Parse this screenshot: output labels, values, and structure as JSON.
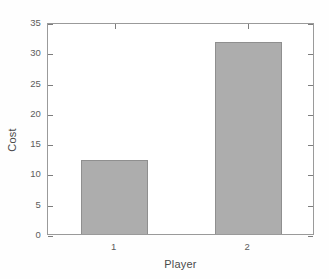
{
  "figure": {
    "background_color": "#ffffff",
    "axis_color": "#9a9a9a",
    "text_color": "#5c5c5c"
  },
  "axis_titles": {
    "x": "Player",
    "y": "Cost"
  },
  "y_ticks": [
    "0",
    "5",
    "10",
    "15",
    "20",
    "25",
    "30",
    "35"
  ],
  "x_ticks": [
    "1",
    "2"
  ],
  "chart_data": {
    "type": "bar",
    "title": "",
    "xlabel": "Player",
    "ylabel": "Cost",
    "categories": [
      "1",
      "2"
    ],
    "values": [
      12.3,
      31.7
    ],
    "ylim": [
      0,
      35
    ],
    "ytick_values": [
      0,
      5,
      10,
      15,
      20,
      25,
      30,
      35
    ],
    "xtick_labels": [
      "1",
      "2"
    ],
    "grid": false,
    "legend": false,
    "bar_fill_color": "#adadad",
    "bar_edge_color": "#8f8f8f",
    "bar_width_fraction": 0.5
  }
}
